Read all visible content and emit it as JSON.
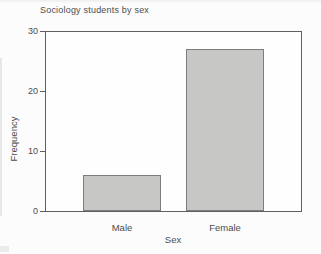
{
  "chart_data": {
    "type": "bar",
    "title": "Sociology students by sex",
    "categories": [
      "Male",
      "Female"
    ],
    "values": [
      6,
      27
    ],
    "xlabel": "Sex",
    "ylabel": "Frequency",
    "ylim": [
      0,
      30
    ],
    "yticks": [
      0,
      10,
      20,
      30
    ],
    "grid": false,
    "legend": false,
    "bar_fill": "#c7c8c5",
    "bar_border": "#7d7d7d",
    "axis_color": "#5f5f5f",
    "text_color": "#4c4c4c"
  }
}
